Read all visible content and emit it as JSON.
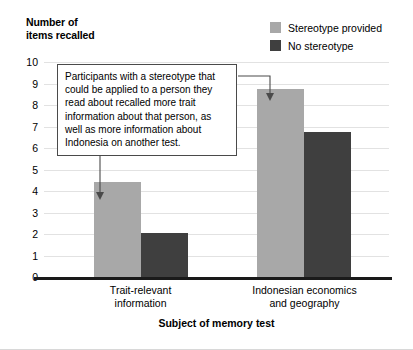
{
  "chart_data": {
    "type": "bar",
    "title": "",
    "ylabel": "Number of\nitems recalled",
    "xlabel": "Subject of memory test",
    "categories": [
      "Trait-relevant\ninformation",
      "Indonesian economics\nand geography"
    ],
    "series": [
      {
        "name": "Stereotype provided",
        "color": "#a8a8a8",
        "values": [
          4.4,
          8.75
        ]
      },
      {
        "name": "No stereotype",
        "color": "#3f3f3f",
        "values": [
          2.05,
          6.75
        ]
      }
    ],
    "ylim": [
      0,
      10
    ],
    "yticks": [
      "0",
      "1",
      "2",
      "3",
      "4",
      "5",
      "6",
      "7",
      "8",
      "9",
      "10"
    ],
    "grid": true,
    "legend_position": "top-right",
    "annotations": [
      {
        "text": "Participants with a stereotype that could be applied to a person they read about recalled more trait information about that person, as well as more information about Indonesia on another test.",
        "points_to": [
          "Stereotype provided bar in Trait-relevant information",
          "Stereotype provided bar in Indonesian economics and geography"
        ]
      }
    ]
  },
  "legend": {
    "items": [
      {
        "label": "Stereotype provided",
        "color": "#a8a8a8"
      },
      {
        "label": "No stereotype",
        "color": "#3f3f3f"
      }
    ]
  },
  "axes": {
    "y_title": "Number of\nitems recalled",
    "x_title": "Subject of memory test"
  },
  "callout": {
    "text": "Participants with a stereotype that could be applied to a person they read about recalled more trait information about that person, as well as more information about Indonesia on another test."
  }
}
